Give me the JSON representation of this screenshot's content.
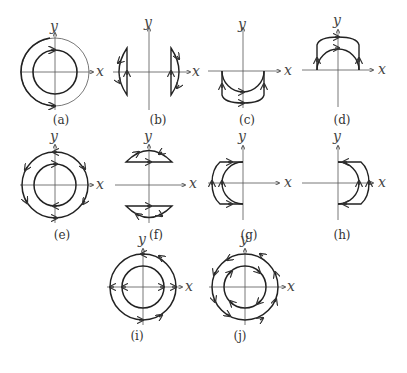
{
  "figure": {
    "panels": [
      {
        "id": "a",
        "caption": "(a)",
        "x_label": "x",
        "y_label": "y",
        "description": "Two concentric circles; inner circle bold with arrows at top and bottom (clockwise-right at top)"
      },
      {
        "id": "b",
        "caption": "(b)",
        "x_label": "x",
        "y_label": "y",
        "description": "Two closed curve segments left and right of y-axis, each bounded by vertical line and arc"
      },
      {
        "id": "c",
        "caption": "(c)",
        "x_label": "x",
        "y_label": "y",
        "description": "Region below x-axis between inner semicircle and outer rectangular-ish curve"
      },
      {
        "id": "d",
        "caption": "(d)",
        "x_label": "x",
        "y_label": "y",
        "description": "Region above x-axis between inner semicircle and outer arc"
      },
      {
        "id": "e",
        "caption": "(e)",
        "x_label": "x",
        "y_label": "y",
        "description": "Annulus with both circles oriented, arrows on both"
      },
      {
        "id": "f",
        "caption": "(f)",
        "x_label": "x",
        "y_label": "y",
        "description": "Two circular segments above and below x-axis with horizontal chords"
      },
      {
        "id": "g",
        "caption": "(g)",
        "x_label": "x",
        "y_label": "y",
        "description": "Region left of y-axis between inner semicircle and outer curve"
      },
      {
        "id": "h",
        "caption": "(h)",
        "x_label": "x",
        "y_label": "y",
        "description": "Region right of y-axis between inner semicircle and outer curve"
      },
      {
        "id": "i",
        "caption": "(i)",
        "x_label": "x",
        "y_label": "y",
        "description": "Annulus with arrows on outer circle and on x-axis crossings"
      },
      {
        "id": "j",
        "caption": "(j)",
        "x_label": "x",
        "y_label": "y",
        "description": "Annulus, outer circle counterclockwise arrows, inner circle clockwise arrows"
      }
    ]
  }
}
